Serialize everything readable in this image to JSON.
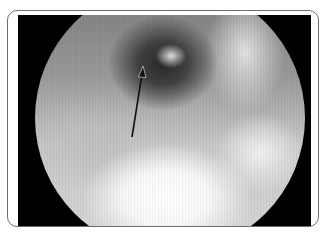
{
  "figure": {
    "colors": {
      "frame_border": "#6e6e6e",
      "background": "#000000",
      "arrow": "#111111"
    },
    "annotations": [
      {
        "type": "arrow",
        "from": [
          132,
          137
        ],
        "to": [
          143,
          67
        ]
      }
    ]
  }
}
